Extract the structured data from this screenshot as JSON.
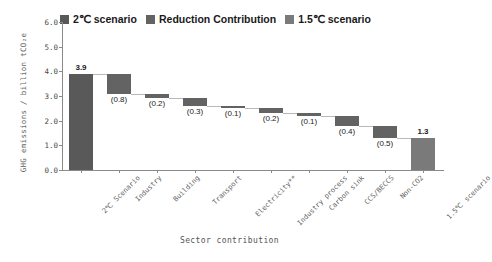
{
  "legend": {
    "items": [
      {
        "label": "2℃ scenario",
        "color": "#595959",
        "icon": "legend-swatch"
      },
      {
        "label": "Reduction Contribution",
        "color": "#636363",
        "icon": "legend-swatch"
      },
      {
        "label": "1.5℃ scenario",
        "color": "#7a7a7a",
        "icon": "legend-swatch"
      }
    ]
  },
  "axes": {
    "ylabel": "GHG emissions / billion tCO₂e",
    "xlabel": "Sector contribution",
    "yticks": [
      "0.0",
      "1.0",
      "2.0",
      "3.0",
      "4.0",
      "5.0",
      "6.0"
    ]
  },
  "chart_data": {
    "type": "bar",
    "subtype": "waterfall",
    "title": "",
    "xlabel": "Sector contribution",
    "ylabel": "GHG emissions / billion tCO₂e",
    "ylim": [
      0.0,
      6.0
    ],
    "ytick_step": 1.0,
    "grid": false,
    "legend_position": "top",
    "categories": [
      "2℃ Scenario",
      "Industry",
      "Building",
      "Transport",
      "Electricity**",
      "Industry process",
      "Carbon sink",
      "CCS/BECCS",
      "Non-CO2",
      "1.5℃ scenario"
    ],
    "labels": [
      "3.9",
      "(0.8)",
      "(0.2)",
      "(0.3)",
      "(0.1)",
      "(0.2)",
      "(0.1)",
      "(0.4)",
      "(0.5)",
      "1.3"
    ],
    "kinds": [
      "total",
      "reduction",
      "reduction",
      "reduction",
      "reduction",
      "reduction",
      "reduction",
      "reduction",
      "reduction",
      "total"
    ],
    "values": [
      3.9,
      -0.8,
      -0.2,
      -0.3,
      -0.1,
      -0.2,
      -0.1,
      -0.4,
      -0.5,
      1.3
    ],
    "bar_bottoms": [
      0.0,
      3.1,
      2.9,
      2.6,
      2.5,
      2.3,
      2.2,
      1.8,
      1.3,
      0.0
    ],
    "bar_tops": [
      3.9,
      3.9,
      3.1,
      2.9,
      2.6,
      2.5,
      2.3,
      2.2,
      1.8,
      1.3
    ],
    "series": [
      {
        "name": "2℃ scenario",
        "values": [
          3.9,
          null,
          null,
          null,
          null,
          null,
          null,
          null,
          null,
          null
        ]
      },
      {
        "name": "Reduction Contribution",
        "values": [
          null,
          -0.8,
          -0.2,
          -0.3,
          -0.1,
          -0.2,
          -0.1,
          -0.4,
          -0.5,
          null
        ]
      },
      {
        "name": "1.5℃ scenario",
        "values": [
          null,
          null,
          null,
          null,
          null,
          null,
          null,
          null,
          null,
          1.3
        ]
      }
    ]
  },
  "colors": {
    "total_bar": "#595959",
    "reduction_bar": "#636363",
    "final_bar": "#7a7a7a",
    "axis": "#8a8a8a",
    "connector": "#b9b9b9",
    "text": "#1a1a1a"
  }
}
